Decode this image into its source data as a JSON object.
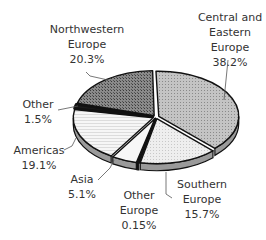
{
  "chart_data": {
    "type": "pie",
    "style": "3d-exploded",
    "title": "",
    "unit": "%",
    "slices": [
      {
        "label": "Central and Eastern Europe",
        "value": 38.2,
        "label_lines": [
          "Central and",
          "Eastern",
          "Europe",
          "38.2%"
        ],
        "fill": "#bdbdbd",
        "pattern": "dots"
      },
      {
        "label": "Southern Europe",
        "value": 15.7,
        "label_lines": [
          "Southern",
          "Europe",
          "15.7%"
        ],
        "fill": "#ebebeb",
        "pattern": "fine-dots"
      },
      {
        "label": "Other Europe",
        "value": 0.15,
        "label_lines": [
          "Other",
          "Europe",
          "0.15%"
        ],
        "fill": "#222222",
        "pattern": "solid"
      },
      {
        "label": "Asia",
        "value": 5.1,
        "label_lines": [
          "Asia",
          "5.1%"
        ],
        "fill": "#f7f7f7",
        "pattern": "light"
      },
      {
        "label": "Americas",
        "value": 19.1,
        "label_lines": [
          "Americas",
          "19.1%"
        ],
        "fill": "#f2f2f2",
        "pattern": "horizontal-lines"
      },
      {
        "label": "Other",
        "value": 1.5,
        "label_lines": [
          "Other",
          "1.5%"
        ],
        "fill": "#1a1a1a",
        "pattern": "solid"
      },
      {
        "label": "Northwestern Europe",
        "value": 20.3,
        "label_lines": [
          "Northwestern",
          "Europe",
          "20.3%"
        ],
        "fill": "#7a7a7a",
        "pattern": "dark-dots"
      }
    ]
  }
}
